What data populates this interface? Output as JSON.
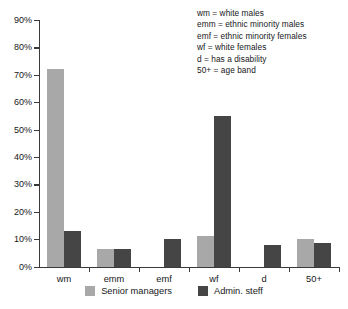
{
  "chart_data": {
    "type": "bar",
    "title": "",
    "xlabel": "",
    "ylabel": "",
    "ylim": [
      0,
      90
    ],
    "grid": false,
    "legend_position": "bottom",
    "categories": [
      "wm",
      "emm",
      "emf",
      "wf",
      "d",
      "50+"
    ],
    "ytick_labels": [
      "0%",
      "10%",
      "20%",
      "30%",
      "40%",
      "50%",
      "60%",
      "70%",
      "80%",
      "90%"
    ],
    "ytick_values": [
      0,
      10,
      20,
      30,
      40,
      50,
      60,
      70,
      80,
      90
    ],
    "series": [
      {
        "name": "Senior managers",
        "color": "#a8a8a8",
        "values": [
          72,
          6.5,
          0,
          11,
          0,
          10
        ]
      },
      {
        "name": "Admin. steff",
        "color": "#454545",
        "values": [
          13,
          6.5,
          10,
          55,
          8,
          8.5
        ]
      }
    ],
    "annotations": [
      "wm = white males",
      "emm = ethnic minority males",
      "emf = ethnic minority females",
      "wf = white females",
      "d = has a disability",
      "50+ = age band"
    ]
  }
}
